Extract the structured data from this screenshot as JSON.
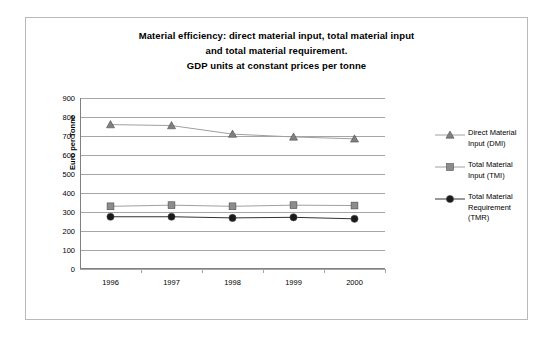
{
  "chart_data": {
    "type": "line",
    "title": "Material efficiency: direct material input, total material input and total material requirement. GDP units at constant prices per tonne",
    "title_lines": [
      "Material efficiency: direct material input, total material input",
      "and total material requirement.",
      "GDP units at constant prices per tonne"
    ],
    "xlabel": "",
    "ylabel": "Euro per Tonne",
    "categories": [
      "1996",
      "1997",
      "1998",
      "1999",
      "2000"
    ],
    "ylim": [
      0,
      900
    ],
    "ytick_values": [
      0,
      100,
      200,
      300,
      400,
      500,
      600,
      700,
      800,
      900
    ],
    "ytick_labels": [
      "0",
      "100",
      "200",
      "300",
      "400",
      "500",
      "600",
      "700",
      "800",
      "900"
    ],
    "grid": true,
    "legend_position": "right",
    "series": [
      {
        "name": "Direct Material Input (DMI)",
        "legend_lines": [
          "Direct Material",
          "Input (DMI)"
        ],
        "marker": "triangle",
        "color": "#808080",
        "line_color": "#a0a0a0",
        "values": [
          760,
          755,
          710,
          695,
          685
        ]
      },
      {
        "name": "Total Material Input (TMI)",
        "legend_lines": [
          "Total Material",
          "Input (TMI)"
        ],
        "marker": "square",
        "color": "#8c8c8c",
        "line_color": "#a0a0a0",
        "values": [
          330,
          336,
          330,
          336,
          334
        ]
      },
      {
        "name": "Total Material Requirement (TMR)",
        "legend_lines": [
          "Total Material",
          "Requirement",
          "(TMR)"
        ],
        "marker": "circle",
        "color": "#1a1a1a",
        "line_color": "#333333",
        "values": [
          275,
          275,
          269,
          272,
          264
        ]
      }
    ]
  }
}
